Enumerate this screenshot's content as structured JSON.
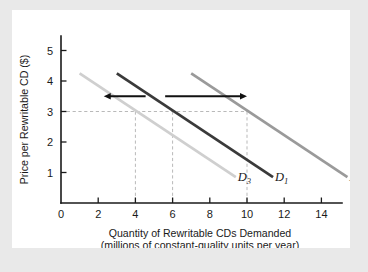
{
  "figure": {
    "background_color": "#e9e9e9",
    "panel_color": "#ffffff"
  },
  "chart_data": {
    "type": "line",
    "title": "",
    "xlabel": "Quantity of Rewritable CDs Demanded",
    "xlabel_line2": "(millions of constant-quality units per year)",
    "ylabel": "Price per Rewritable CD ($)",
    "xlim": [
      0,
      16
    ],
    "ylim": [
      0,
      5.6
    ],
    "x_ticks": [
      0,
      2,
      4,
      6,
      8,
      10,
      12,
      14
    ],
    "x_tick_labels": [
      "0",
      "2",
      "4",
      "6",
      "8",
      "10",
      "12",
      "14"
    ],
    "y_ticks": [
      1,
      2,
      3,
      4,
      5
    ],
    "y_tick_labels": [
      "1",
      "2",
      "3",
      "4",
      "5"
    ],
    "grid": false,
    "legend_position": "inline-curve-labels",
    "reference_lines": {
      "horizontal_price": 3,
      "vertical_quantities": [
        4,
        6,
        10
      ]
    },
    "series": [
      {
        "name": "D3",
        "label": "D",
        "subscript": "3",
        "color": "#cfcfcf",
        "x": [
          1.0,
          9.4
        ],
        "y": [
          4.25,
          0.85
        ],
        "label_x": 9.5,
        "label_y": 0.72,
        "equilibrium_point": [
          4,
          3
        ]
      },
      {
        "name": "D1",
        "label": "D",
        "subscript": "1",
        "color": "#3a3a3a",
        "x": [
          3.0,
          11.4
        ],
        "y": [
          4.25,
          0.85
        ],
        "label_x": 11.5,
        "label_y": 0.72,
        "equilibrium_point": [
          6,
          3
        ]
      },
      {
        "name": "D2",
        "label": "D",
        "subscript": "2",
        "color": "#9a9a9a",
        "x": [
          7.0,
          15.4
        ],
        "y": [
          4.25,
          0.85
        ],
        "label_x": 15.5,
        "label_y": 0.72,
        "equilibrium_point": [
          10,
          3
        ]
      }
    ],
    "annotations": [
      {
        "name": "decrease-in-demand-arrow",
        "direction": "left",
        "y": 3.5,
        "x_start": 4.55,
        "x_end": 2.3,
        "description": "arrow pointing left indicating decrease in demand"
      },
      {
        "name": "increase-in-demand-arrow",
        "direction": "right",
        "y": 3.5,
        "x_start": 5.6,
        "x_end": 10.0,
        "description": "arrow pointing right indicating increase in demand"
      }
    ]
  }
}
